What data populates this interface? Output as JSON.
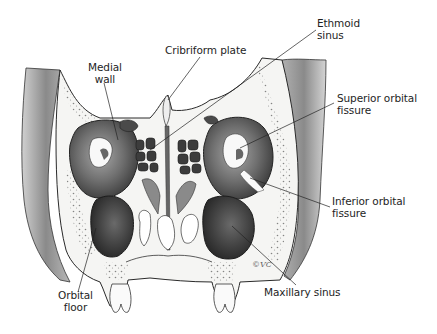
{
  "figure": {
    "labels": [
      {
        "id": "medial-wall",
        "lines": [
          "Medial",
          "wall"
        ]
      },
      {
        "id": "cribriform-plate",
        "lines": [
          "Cribriform plate"
        ]
      },
      {
        "id": "ethmoid-sinus",
        "lines": [
          "Ethmoid",
          "sinus"
        ]
      },
      {
        "id": "superior-orbital-fissure",
        "lines": [
          "Superior orbital",
          "fissure"
        ]
      },
      {
        "id": "inferior-orbital-fissure",
        "lines": [
          "Inferior orbital",
          "fissure"
        ]
      },
      {
        "id": "maxillary-sinus",
        "lines": [
          "Maxillary sinus"
        ]
      },
      {
        "id": "orbital-floor",
        "lines": [
          "Orbital",
          "floor"
        ]
      }
    ],
    "signature": "©VC",
    "colors": {
      "background": "#ffffff",
      "ink": "#1e1e1e",
      "bone": "#f4f4f2",
      "shade_dark": "#3a3a3a",
      "shade_mid": "#777777",
      "shade_light": "#bdbdbd"
    }
  }
}
